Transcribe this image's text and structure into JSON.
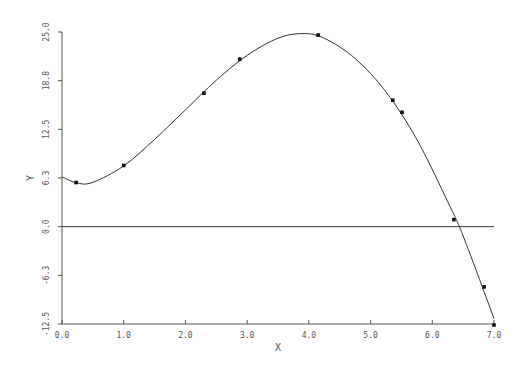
{
  "chart_data": {
    "type": "scatter",
    "title": "",
    "xlabel": "X",
    "ylabel": "Y",
    "xlim": [
      0.0,
      7.0
    ],
    "ylim": [
      -12.5,
      25.0
    ],
    "grid": false,
    "legend": null,
    "x_ticks": [
      "0.0",
      "1.0",
      "2.0",
      "3.0",
      "4.0",
      "5.0",
      "6.0",
      "7.0"
    ],
    "x_tick_values": [
      0,
      1,
      2,
      3,
      4,
      5,
      6,
      7
    ],
    "y_ticks": [
      "25.0",
      "18.8",
      "12.5",
      "6.3",
      "0.0",
      "-6.3",
      "-12.5"
    ],
    "y_tick_values": [
      25.0,
      18.75,
      12.5,
      6.25,
      0.0,
      -6.25,
      -12.5
    ],
    "reference_line": {
      "y": 0.0,
      "label": "zero line"
    },
    "series": [
      {
        "name": "data points",
        "marker": "square",
        "x": [
          0.23,
          1.0,
          2.3,
          2.88,
          4.15,
          5.36,
          5.51,
          6.35,
          6.84,
          7.0
        ],
        "y": [
          5.67,
          7.86,
          17.14,
          21.52,
          24.61,
          16.24,
          14.69,
          0.9,
          -7.73,
          -12.63
        ]
      },
      {
        "name": "fitted curve",
        "marker": "none",
        "x": [
          0.0,
          0.25,
          0.5,
          1.0,
          1.5,
          2.0,
          2.5,
          3.0,
          3.5,
          3.9,
          4.25,
          4.75,
          5.25,
          5.75,
          6.25,
          6.5,
          7.0
        ],
        "y": [
          6.4,
          5.6,
          5.7,
          7.8,
          11.2,
          15.0,
          18.8,
          22.0,
          24.2,
          24.8,
          24.2,
          21.6,
          17.3,
          11.2,
          3.2,
          -1.2,
          -11.8
        ]
      }
    ],
    "colors": {
      "line": "#333333",
      "axis": "#555555",
      "marker": "#111111"
    }
  }
}
